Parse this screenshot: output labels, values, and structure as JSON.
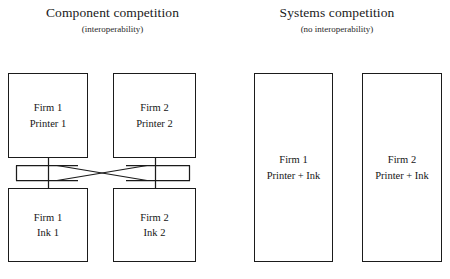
{
  "panels": {
    "left": {
      "title": "Component competition",
      "subtitle": "(interoperability)",
      "boxes": [
        {
          "name": "firm1-printer",
          "line1": "Firm 1",
          "line2": "Printer 1"
        },
        {
          "name": "firm2-printer",
          "line1": "Firm 2",
          "line2": "Printer 2"
        },
        {
          "name": "firm1-ink",
          "line1": "Firm 1",
          "line2": "Ink 1"
        },
        {
          "name": "firm2-ink",
          "line1": "Firm 2",
          "line2": "Ink 2"
        }
      ]
    },
    "right": {
      "title": "Systems competition",
      "subtitle": "(no interoperability)",
      "boxes": [
        {
          "name": "firm1-system",
          "line1": "Firm 1",
          "line2": "Printer + Ink"
        },
        {
          "name": "firm2-system",
          "line1": "Firm 2",
          "line2": "Printer + Ink"
        }
      ]
    }
  },
  "colors": {
    "stroke": "#1b1b1b",
    "background": "#ffffff",
    "text": "#151515"
  }
}
